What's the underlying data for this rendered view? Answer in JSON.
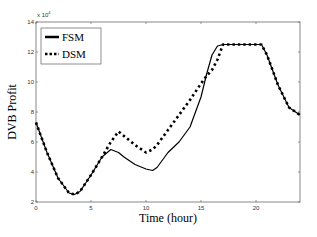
{
  "chart_data": {
    "type": "line",
    "title": "",
    "xlabel": "Time (hour)",
    "ylabel": "DVB Profit",
    "y_exponent": "x 10^4",
    "xlim": [
      0,
      24
    ],
    "ylim": [
      2,
      14
    ],
    "xticks": [
      0,
      5,
      10,
      15,
      20
    ],
    "yticks": [
      2,
      4,
      6,
      8,
      10,
      12,
      14
    ],
    "grid": false,
    "legend_position": "upper-left",
    "x": [
      0,
      1,
      2,
      3,
      3.5,
      4,
      5,
      6,
      6.8,
      7.5,
      8,
      9,
      10,
      10.6,
      11,
      12,
      13,
      14,
      15,
      15.5,
      16,
      16.5,
      17,
      18,
      19,
      20,
      20.5,
      21,
      22,
      23,
      24
    ],
    "series": [
      {
        "name": "FSM",
        "style": "solid",
        "values": [
          7.3,
          5.3,
          3.6,
          2.6,
          2.5,
          2.7,
          3.8,
          5.0,
          5.5,
          5.3,
          5.0,
          4.5,
          4.2,
          4.1,
          4.3,
          5.3,
          6.0,
          7.0,
          9.0,
          10.5,
          11.8,
          12.4,
          12.5,
          12.5,
          12.5,
          12.5,
          12.5,
          11.8,
          9.8,
          8.3,
          7.8
        ]
      },
      {
        "name": "DSM",
        "style": "dotted",
        "values": [
          7.3,
          5.3,
          3.6,
          2.6,
          2.5,
          2.7,
          3.8,
          5.0,
          6.0,
          6.7,
          6.4,
          5.8,
          5.3,
          5.5,
          5.8,
          6.8,
          7.8,
          8.8,
          9.9,
          10.4,
          10.8,
          11.5,
          12.5,
          12.5,
          12.5,
          12.5,
          12.5,
          11.8,
          9.8,
          8.3,
          7.8
        ]
      }
    ]
  },
  "legend": {
    "fsm": "FSM",
    "dsm": "DSM"
  },
  "axes": {
    "xlabel": "Time (hour)",
    "ylabel": "DVB Profit",
    "exponent_base": "x 10",
    "exponent_power": "4"
  }
}
